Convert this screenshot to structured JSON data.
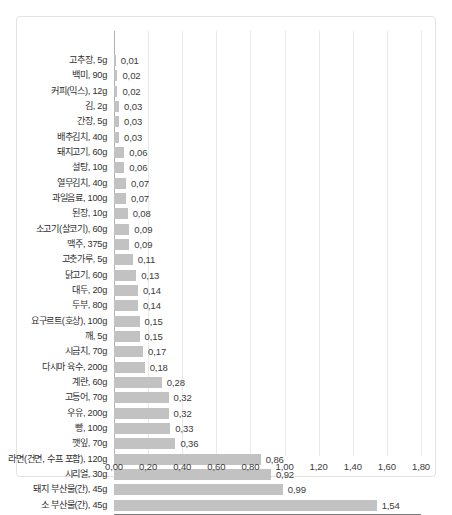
{
  "chart_data": {
    "type": "bar",
    "orientation": "horizontal",
    "title": "",
    "subtitle": "",
    "xlabel": "",
    "ylabel": "",
    "xlim": [
      0.0,
      1.8
    ],
    "xticks": [
      "0,00",
      "0,20",
      "0,40",
      "0,60",
      "0,80",
      "1,00",
      "1,20",
      "1,40",
      "1,60",
      "1,80"
    ],
    "xtick_values": [
      0.0,
      0.2,
      0.4,
      0.6,
      0.8,
      1.0,
      1.2,
      1.4,
      1.6,
      1.8
    ],
    "grid": true,
    "legend": false,
    "legend_position": "none",
    "bar_color": "#c2c2c2",
    "gridline_color": "#e9e9e9",
    "axis_color": "#b0b0b0",
    "categories": [
      "고추장, 5g",
      "백미, 90g",
      "커피(믹스), 12g",
      "김, 2g",
      "간장, 5g",
      "배추김치, 40g",
      "돼지고기, 60g",
      "설탕, 10g",
      "열무김치, 40g",
      "과일음료, 100g",
      "된장, 10g",
      "소고기(살코기), 60g",
      "맥주, 375g",
      "고춧가루, 5g",
      "닭고기, 60g",
      "대두, 20g",
      "두부, 80g",
      "요구르트(호상), 100g",
      "깨, 5g",
      "시금치, 70g",
      "다시마 육수, 200g",
      "계란, 60g",
      "고등어, 70g",
      "우유, 200g",
      "빵, 100g",
      "깻잎, 70g",
      "라면(건면, 수프 포함), 120g",
      "시리얼, 30g",
      "돼지 부산물(간), 45g",
      "소 부산물(간), 45g"
    ],
    "values": [
      0.01,
      0.02,
      0.02,
      0.03,
      0.03,
      0.03,
      0.06,
      0.06,
      0.07,
      0.07,
      0.08,
      0.09,
      0.09,
      0.11,
      0.13,
      0.14,
      0.14,
      0.15,
      0.15,
      0.17,
      0.18,
      0.28,
      0.32,
      0.32,
      0.33,
      0.36,
      0.86,
      0.92,
      0.99,
      1.54
    ],
    "value_labels": [
      "0,01",
      "0,02",
      "0,02",
      "0,03",
      "0,03",
      "0,03",
      "0,06",
      "0,06",
      "0,07",
      "0,07",
      "0,08",
      "0,09",
      "0,09",
      "0,11",
      "0,13",
      "0,14",
      "0,14",
      "0,15",
      "0,15",
      "0,17",
      "0,18",
      "0,28",
      "0,32",
      "0,32",
      "0,33",
      "0,36",
      "0,86",
      "0,92",
      "0,99",
      "1,54"
    ]
  }
}
